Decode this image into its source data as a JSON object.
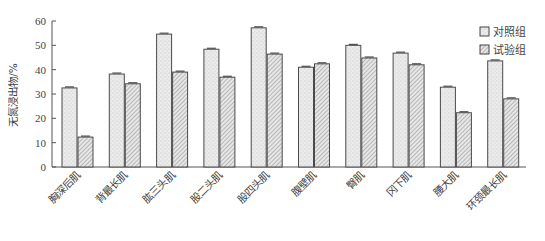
{
  "chart_data": {
    "type": "bar",
    "title": "",
    "xlabel": "",
    "ylabel": "无氮浸出物/%",
    "ylim": [
      0,
      60
    ],
    "yticks": [
      0,
      10,
      20,
      30,
      40,
      50,
      60
    ],
    "grid": false,
    "legend_position": "top-right",
    "error_bars": true,
    "categories": [
      "胸深后肌",
      "背最长肌",
      "肱三头肌",
      "股二头肌",
      "股四头肌",
      "腹壁肌",
      "臀肌",
      "冈下肌",
      "腰大肌",
      "环颈最长肌"
    ],
    "series": [
      {
        "name": "对照组",
        "pattern": "stipple",
        "values": [
          32.5,
          38.2,
          54.6,
          48.4,
          57.2,
          41.0,
          50.0,
          46.8,
          32.8,
          43.6
        ]
      },
      {
        "name": "试验组",
        "pattern": "hatch",
        "values": [
          12.3,
          34.2,
          39.0,
          36.9,
          46.4,
          42.4,
          44.8,
          42.0,
          22.3,
          28.0
        ]
      }
    ]
  },
  "legend": {
    "items": [
      {
        "label": "对照组"
      },
      {
        "label": "试验组"
      }
    ]
  },
  "axis": {
    "ylabel": "无氮浸出物/%",
    "yticks": [
      "0",
      "10",
      "20",
      "30",
      "40",
      "50",
      "60"
    ]
  }
}
